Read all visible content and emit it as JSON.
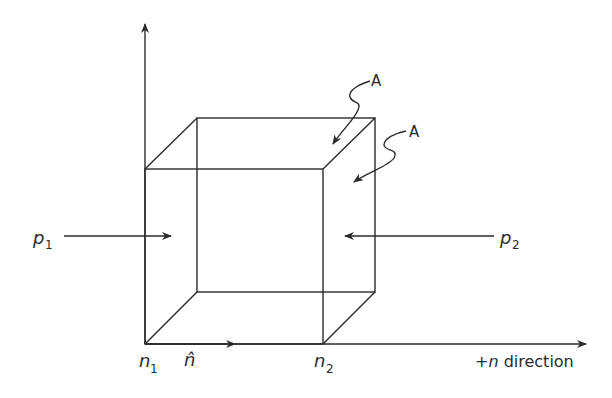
{
  "diagram": {
    "colors": {
      "line": "#2b2b2b",
      "background": "#ffffff"
    },
    "labels": {
      "p1": "p",
      "p1_sub": "1",
      "p2": "p",
      "p2_sub": "2",
      "area_top": "A",
      "area_side": "A",
      "n1": "n",
      "n1_sub": "1",
      "n2": "n",
      "n2_sub": "2",
      "n_hat": "n̂",
      "axis_prefix": "+",
      "axis_var": "n",
      "axis_suffix": " direction"
    }
  }
}
